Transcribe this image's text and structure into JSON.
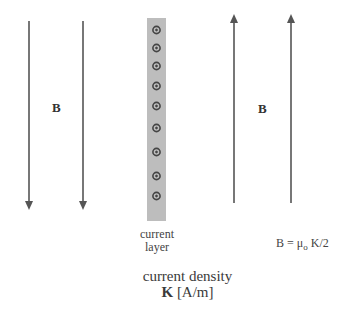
{
  "diagram": {
    "left_field": {
      "label": "B",
      "direction": "down",
      "arrows_x": [
        29,
        83
      ],
      "y_top": 21,
      "y_tip": 210
    },
    "right_field": {
      "label": "B",
      "direction": "up",
      "arrows_x": [
        234,
        291
      ],
      "y_tip": 14,
      "y_bottom": 203
    },
    "current_layer": {
      "caption_line1": "current",
      "caption_line2": "layer",
      "dot_symbol": "out-of-page current (dot in circle)",
      "dot_count": 9,
      "dots_y": [
        30,
        48,
        66,
        86,
        106,
        128,
        152,
        176,
        196
      ],
      "strip_color": "#bdbdbd"
    },
    "current_density": {
      "line1": "current density",
      "symbol": "K",
      "units": "[A/m]"
    },
    "formula": {
      "lhs": "B = μ",
      "subscript": "o",
      "rhs": " K/2"
    },
    "colors": {
      "arrow": "#555555",
      "strip": "#bdbdbd",
      "dot": "#444444"
    }
  }
}
